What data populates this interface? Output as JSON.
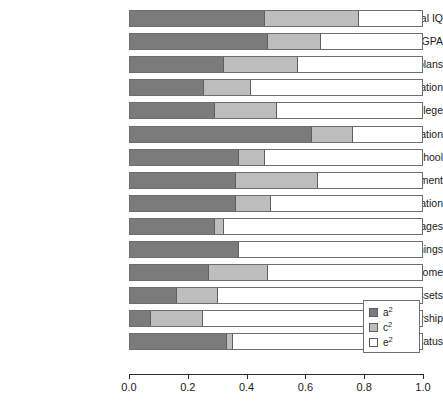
{
  "chart_data": {
    "type": "bar",
    "orientation": "horizontal",
    "stacked": true,
    "title": "",
    "subtitle": "",
    "xlabel": "",
    "ylabel": "",
    "xlim": [
      0.0,
      1.0
    ],
    "grid": false,
    "legend_position": "bottom-right",
    "xticks": [
      "0.0",
      "0.2",
      "0.4",
      "0.6",
      "0.8",
      "1.0"
    ],
    "xtick_values": [
      0.0,
      0.2,
      0.4,
      0.6,
      0.8,
      1.0
    ],
    "categories": [
      "Verbal IQ",
      "GPA",
      "College plans",
      "HS graduation",
      "Some college",
      "College graduation",
      "Graduate school",
      "Educational attainment",
      "Occupational education",
      "Occupational wages",
      "Personal earnings",
      "Household income",
      "Household assets",
      "Home ownership",
      "Subjective social status"
    ],
    "series": [
      {
        "name": "a2",
        "label": "a²",
        "color": "#7b7b7b",
        "values": [
          0.46,
          0.47,
          0.32,
          0.25,
          0.29,
          0.62,
          0.37,
          0.36,
          0.36,
          0.29,
          0.37,
          0.27,
          0.16,
          0.07,
          0.33
        ]
      },
      {
        "name": "c2",
        "label": "c²",
        "color": "#bdbdbd",
        "values": [
          0.32,
          0.18,
          0.25,
          0.16,
          0.21,
          0.14,
          0.09,
          0.28,
          0.12,
          0.03,
          0.0,
          0.2,
          0.14,
          0.18,
          0.02
        ]
      },
      {
        "name": "e2",
        "label": "e²",
        "color": "#ffffff",
        "values": [
          0.22,
          0.35,
          0.43,
          0.59,
          0.5,
          0.24,
          0.54,
          0.36,
          0.52,
          0.68,
          0.63,
          0.53,
          0.7,
          0.75,
          0.65
        ]
      }
    ],
    "cumulative_boundaries": [
      [
        0.46,
        0.78
      ],
      [
        0.47,
        0.65
      ],
      [
        0.32,
        0.57
      ],
      [
        0.25,
        0.41
      ],
      [
        0.29,
        0.5
      ],
      [
        0.62,
        0.76
      ],
      [
        0.37,
        0.46
      ],
      [
        0.36,
        0.64
      ],
      [
        0.36,
        0.48
      ],
      [
        0.29,
        0.32
      ],
      [
        0.37,
        0.37
      ],
      [
        0.27,
        0.47
      ],
      [
        0.16,
        0.3
      ],
      [
        0.07,
        0.25
      ],
      [
        0.33,
        0.35
      ]
    ]
  },
  "legend": {
    "items": [
      {
        "label_base": "a",
        "label_sup": "2",
        "swatch": "#7b7b7b"
      },
      {
        "label_base": "c",
        "label_sup": "2",
        "swatch": "#bdbdbd"
      },
      {
        "label_base": "e",
        "label_sup": "2",
        "swatch": "#ffffff"
      }
    ]
  },
  "axis": {
    "caption": ""
  },
  "colors": {
    "a2": "#7b7b7b",
    "c2": "#bdbdbd",
    "e2": "#ffffff",
    "outline": "#6e6e6e",
    "axis": "#2b2b2b",
    "text": "#1a1a1a"
  }
}
